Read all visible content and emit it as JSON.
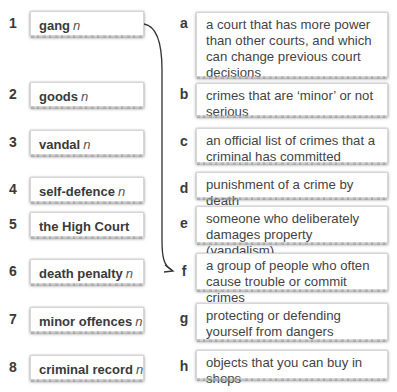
{
  "exercise": {
    "terms": [
      {
        "number": "1",
        "word": "gang",
        "pos": "n"
      },
      {
        "number": "2",
        "word": "goods",
        "pos": "n"
      },
      {
        "number": "3",
        "word": "vandal",
        "pos": "n"
      },
      {
        "number": "4",
        "word": "self-defence",
        "pos": "n"
      },
      {
        "number": "5",
        "word": "the High Court",
        "pos": ""
      },
      {
        "number": "6",
        "word": "death penalty",
        "pos": "n"
      },
      {
        "number": "7",
        "word": "minor offences",
        "pos": "n"
      },
      {
        "number": "8",
        "word": "criminal record",
        "pos": "n"
      }
    ],
    "definitions": [
      {
        "letter": "a",
        "text": "a court that has more power than other courts, and which can change previous court decisions"
      },
      {
        "letter": "b",
        "text": "crimes that are ‘minor’ or not serious"
      },
      {
        "letter": "c",
        "text": "an official list of crimes that a criminal has committed"
      },
      {
        "letter": "d",
        "text": "punishment of a crime by death"
      },
      {
        "letter": "e",
        "text": "someone who deliberately damages property (vandalism)"
      },
      {
        "letter": "f",
        "text": "a group of people who often cause trouble or commit crimes"
      },
      {
        "letter": "g",
        "text": "protecting or defending yourself from dangers"
      },
      {
        "letter": "h",
        "text": "objects that you can buy in shops"
      }
    ],
    "example_match": {
      "from": "1",
      "to": "f"
    },
    "colors": {
      "arrow": "#333333",
      "box_border": "#d6d6d6",
      "text": "#444444"
    }
  }
}
